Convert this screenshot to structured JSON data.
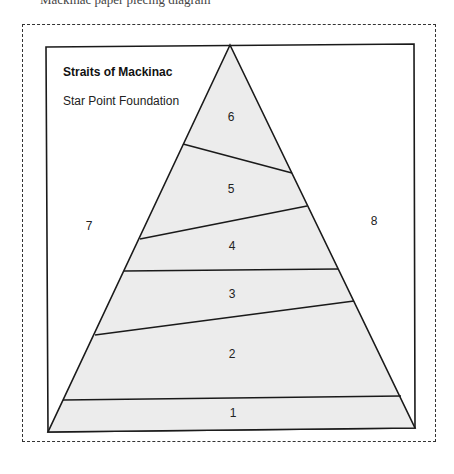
{
  "header": {
    "cut_text": "Mackinac paper piecing diagram"
  },
  "diagram": {
    "title": "Straits of Mackinac",
    "subtitle": "Star Point Foundation",
    "fill_color": "#ececec",
    "line_color": "#1a1a1a",
    "sections": [
      {
        "id": "1",
        "label": "1",
        "x": 233,
        "y": 413
      },
      {
        "id": "2",
        "label": "2",
        "x": 232,
        "y": 354
      },
      {
        "id": "3",
        "label": "3",
        "x": 232,
        "y": 294
      },
      {
        "id": "4",
        "label": "4",
        "x": 232,
        "y": 246
      },
      {
        "id": "5",
        "label": "5",
        "x": 231,
        "y": 189
      },
      {
        "id": "6",
        "label": "6",
        "x": 231,
        "y": 117
      },
      {
        "id": "7",
        "label": "7",
        "x": 89,
        "y": 226
      },
      {
        "id": "8",
        "label": "8",
        "x": 374,
        "y": 221
      }
    ]
  }
}
